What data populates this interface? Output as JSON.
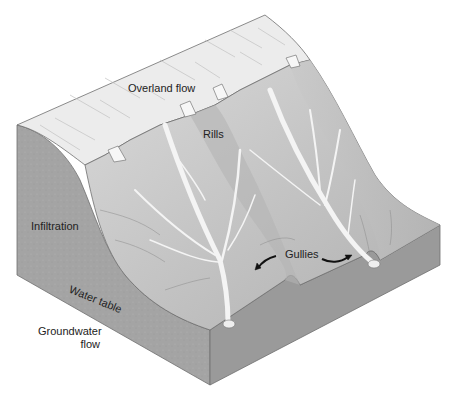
{
  "figure": {
    "labels": {
      "overland_flow": "Overland flow",
      "rills": "Rills",
      "infiltration": "Infiltration",
      "water_table": "Water table",
      "gullies": "Gullies",
      "groundwater_flow_line1": "Groundwater",
      "groundwater_flow_line2": "flow"
    },
    "colors": {
      "plateau": "#ececec",
      "slope_light": "#d6d6d6",
      "slope_mid": "#bdbdbd",
      "slope_dark": "#a8a8a8",
      "soil_face": "#9e9e9e",
      "soil_face_dark": "#8c8c8c",
      "channel": "#f2f2f2",
      "outline": "#6e6e6e",
      "text": "#222222"
    }
  }
}
